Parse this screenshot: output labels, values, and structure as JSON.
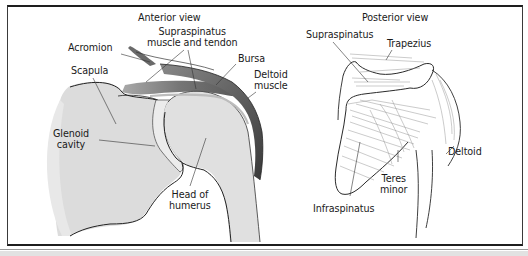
{
  "figure": {
    "type": "anatomical illustration",
    "panels": [
      {
        "id": "anterior",
        "title": "Anterior view",
        "labels": {
          "acromion": "Acromion",
          "supraspinatus_line1": "Supraspinatus",
          "supraspinatus_line2": "muscle and tendon",
          "bursa": "Bursa",
          "deltoid_line1": "Deltoid",
          "deltoid_line2": "muscle",
          "scapula": "Scapula",
          "glenoid_line1": "Glenoid",
          "glenoid_line2": "cavity",
          "humerus_line1": "Head of",
          "humerus_line2": "humerus"
        }
      },
      {
        "id": "posterior",
        "title": "Posterior view",
        "labels": {
          "supraspinatus": "Supraspinatus",
          "trapezius": "Trapezius",
          "deltoid": "Deltoid",
          "teres_line1": "Teres",
          "teres_line2": "minor",
          "infraspinatus": "Infraspinatus"
        }
      }
    ]
  },
  "colors": {
    "bone_fill": "#dedede",
    "muscle_dark": "#5a5a5a",
    "muscle_mid": "#8a8a8a",
    "line": "#2a2a2a",
    "frame": "#1e1e1e"
  }
}
